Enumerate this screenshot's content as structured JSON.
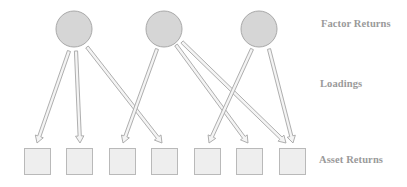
{
  "diagram": {
    "type": "factor-model",
    "labels": {
      "factor_returns": "Factor Returns",
      "loadings": "Loadings",
      "asset_returns": "Asset Returns"
    },
    "factors": [
      {
        "id": "f1",
        "cx": 74,
        "cy": 29,
        "r": 18
      },
      {
        "id": "f2",
        "cx": 164,
        "cy": 29,
        "r": 18
      },
      {
        "id": "f3",
        "cx": 259,
        "cy": 29,
        "r": 18
      }
    ],
    "assets": [
      {
        "id": "a1",
        "x": 24,
        "y": 148,
        "size": 26
      },
      {
        "id": "a2",
        "x": 66,
        "y": 148,
        "size": 26
      },
      {
        "id": "a3",
        "x": 109,
        "y": 148,
        "size": 26
      },
      {
        "id": "a4",
        "x": 151,
        "y": 148,
        "size": 26
      },
      {
        "id": "a5",
        "x": 194,
        "y": 148,
        "size": 26
      },
      {
        "id": "a6",
        "x": 236,
        "y": 148,
        "size": 26
      },
      {
        "id": "a7",
        "x": 279,
        "y": 148,
        "size": 26
      }
    ],
    "loadings": [
      {
        "from": "f1",
        "to": "a1",
        "x1": 69,
        "y1": 51,
        "x2": 37,
        "y2": 143
      },
      {
        "from": "f1",
        "to": "a2",
        "x1": 76,
        "y1": 51,
        "x2": 80,
        "y2": 143
      },
      {
        "from": "f1",
        "to": "a4",
        "x1": 87,
        "y1": 47,
        "x2": 162,
        "y2": 143
      },
      {
        "from": "f2",
        "to": "a3",
        "x1": 157,
        "y1": 49,
        "x2": 123,
        "y2": 143
      },
      {
        "from": "f2",
        "to": "a6",
        "x1": 176,
        "y1": 45,
        "x2": 248,
        "y2": 143
      },
      {
        "from": "f2",
        "to": "a7",
        "x1": 182,
        "y1": 42,
        "x2": 286,
        "y2": 143
      },
      {
        "from": "f3",
        "to": "a5",
        "x1": 252,
        "y1": 49,
        "x2": 209,
        "y2": 143
      },
      {
        "from": "f3",
        "to": "a7",
        "x1": 269,
        "y1": 49,
        "x2": 293,
        "y2": 143
      }
    ],
    "colors": {
      "factor_fill": "#d6d6d6",
      "factor_stroke": "#a9a9a9",
      "asset_fill": "#eeeeee",
      "asset_stroke": "#b9b9b9",
      "arrow_stroke": "#a6a6a6",
      "arrow_fill": "#f4f4f4",
      "label_color": "#9a9a9a"
    }
  }
}
